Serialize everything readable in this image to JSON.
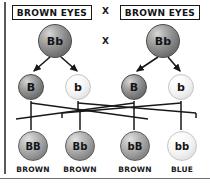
{
  "parents": {
    "cross_symbol": "X",
    "cross_symbol_lower": "X",
    "left": {
      "phenotype": "BROWN EYES",
      "genotype": "Bb",
      "shade": "dark"
    },
    "right": {
      "phenotype": "BROWN EYES",
      "genotype": "Bb",
      "shade": "dark"
    }
  },
  "gametes": [
    {
      "allele": "B",
      "shade": "dark",
      "parent": "left"
    },
    {
      "allele": "b",
      "shade": "light",
      "parent": "left"
    },
    {
      "allele": "B",
      "shade": "dark",
      "parent": "right"
    },
    {
      "allele": "b",
      "shade": "light",
      "parent": "right"
    }
  ],
  "offspring": [
    {
      "genotype": "BB",
      "phenotype": "BROWN",
      "shade": "mid"
    },
    {
      "genotype": "Bb",
      "phenotype": "BROWN",
      "shade": "mid"
    },
    {
      "genotype": "bB",
      "phenotype": "BROWN",
      "shade": "mid"
    },
    {
      "genotype": "bb",
      "phenotype": "BLUE",
      "shade": "light"
    }
  ],
  "colors": {
    "line": "#16181a",
    "box_border": "#17191b",
    "text": "#121416",
    "sphere_dark": "#8d8d8d",
    "sphere_light": "#f0f0f0",
    "sphere_mid": "#a3a3a3",
    "page_rule": "#555a5e",
    "background": "#ffffff"
  }
}
